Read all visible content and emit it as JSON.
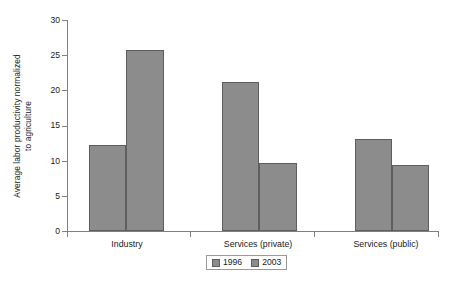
{
  "chart_data": {
    "type": "bar",
    "title": "",
    "xlabel": "",
    "ylabel": "Average labor productivity normalized to agriculture",
    "ylabel_line1": "Average labor productivity normalized",
    "ylabel_line2": "to agriculture",
    "categories": [
      "Industry",
      "Services (private)",
      "Services (public)"
    ],
    "series": [
      {
        "name": "1996",
        "values": [
          12.2,
          21.2,
          13.1
        ],
        "color": "#8c8c8c"
      },
      {
        "name": "2003",
        "values": [
          25.7,
          9.7,
          9.4
        ],
        "color": "#8c8c8c"
      }
    ],
    "ylim": [
      0,
      30
    ],
    "yticks": [
      0,
      5,
      10,
      15,
      20,
      25,
      30
    ],
    "ytick_labels": [
      "0",
      "5",
      "10",
      "15",
      "20",
      "25",
      "30"
    ],
    "grid": false,
    "legend_position": "bottom-center",
    "legend_entries": [
      "1996",
      "2003"
    ],
    "bar_edge_color": "#5e5e5e",
    "axis_color": "#808080"
  }
}
